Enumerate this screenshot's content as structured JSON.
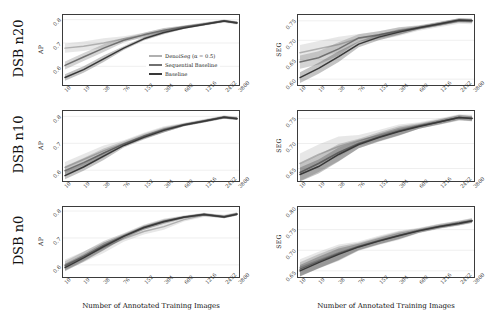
{
  "figure": {
    "xaxis_title": "Number of Annotated Training Images",
    "row_labels": [
      "DSB n20",
      "DSB n10",
      "DSB n0"
    ],
    "col_metrics": [
      "AP",
      "SEG"
    ]
  },
  "legend": {
    "position": "center-right of top-left panel",
    "entries": [
      {
        "label": "DenoiSeg (α = 0.5)",
        "color": "#b0b0b0"
      },
      {
        "label": "Sequential Baseline",
        "color": "#707070"
      },
      {
        "label": "Baseline",
        "color": "#383838"
      }
    ]
  },
  "colors": {
    "denoiseg": "#b0b0b0",
    "sequential_baseline": "#707070",
    "baseline": "#383838",
    "band_opacity": 0.3,
    "axis": "#3b3b3b",
    "grid": "#e3e3e3"
  },
  "chart_data": [
    {
      "id": "dsb-n20-ap",
      "type": "line",
      "title": "",
      "xlabel": "Number of Annotated Training Images",
      "ylabel": "AP",
      "row": "DSB n20",
      "xscale": "log",
      "categories": [
        10,
        19,
        38,
        76,
        152,
        304,
        608,
        1216,
        2432,
        3800
      ],
      "xticklabels": [
        "10",
        "19",
        "38",
        "76",
        "152",
        "304",
        "608",
        "1216",
        "2432",
        "3800"
      ],
      "yticks": [
        0.6,
        0.7,
        0.8
      ],
      "yticklabels": [
        "0.6",
        "0.7",
        "0.8"
      ],
      "ylim": [
        0.52,
        0.82
      ],
      "grid": true,
      "series": [
        {
          "name": "DenoiSeg (α = 0.5)",
          "values": [
            0.678,
            0.686,
            0.7,
            0.718,
            0.733,
            0.752,
            0.768,
            0.78,
            0.793,
            0.785
          ]
        },
        {
          "name": "Sequential Baseline",
          "values": [
            0.604,
            0.64,
            0.678,
            0.712,
            0.735,
            0.755,
            0.77,
            0.782,
            0.795,
            0.788
          ]
        },
        {
          "name": "Baseline",
          "values": [
            0.552,
            0.586,
            0.632,
            0.678,
            0.718,
            0.745,
            0.764,
            0.779,
            0.794,
            0.786
          ]
        }
      ]
    },
    {
      "id": "dsb-n20-seg",
      "type": "line",
      "title": "",
      "xlabel": "Number of Annotated Training Images",
      "ylabel": "SEG",
      "row": "DSB n20",
      "xscale": "log",
      "categories": [
        10,
        19,
        38,
        76,
        152,
        304,
        608,
        1216,
        2432,
        3800
      ],
      "xticklabels": [
        "10",
        "19",
        "38",
        "76",
        "152",
        "304",
        "608",
        "1216",
        "2432",
        "3800"
      ],
      "yticks": [
        0.6,
        0.65,
        0.7,
        0.75
      ],
      "yticklabels": [
        "0.60",
        "0.65",
        "0.70",
        "0.75"
      ],
      "ylim": [
        0.585,
        0.765
      ],
      "grid": true,
      "series": [
        {
          "name": "DenoiSeg (α = 0.5)",
          "values": [
            0.668,
            0.678,
            0.689,
            0.705,
            0.712,
            0.722,
            0.731,
            0.74,
            0.749,
            0.748
          ]
        },
        {
          "name": "Sequential Baseline",
          "values": [
            0.644,
            0.655,
            0.678,
            0.706,
            0.714,
            0.724,
            0.733,
            0.742,
            0.751,
            0.75
          ]
        },
        {
          "name": "Baseline",
          "values": [
            0.604,
            0.628,
            0.658,
            0.69,
            0.708,
            0.721,
            0.732,
            0.742,
            0.752,
            0.751
          ]
        }
      ]
    },
    {
      "id": "dsb-n10-ap",
      "type": "line",
      "title": "",
      "xlabel": "Number of Annotated Training Images",
      "ylabel": "AP",
      "row": "DSB n10",
      "xscale": "log",
      "categories": [
        10,
        19,
        38,
        76,
        152,
        304,
        608,
        1216,
        2432,
        3800
      ],
      "xticklabels": [
        "10",
        "19",
        "38",
        "76",
        "152",
        "304",
        "608",
        "1216",
        "2432",
        "3800"
      ],
      "yticks": [
        0.6,
        0.7,
        0.8
      ],
      "yticklabels": [
        "0.6",
        "0.7",
        "0.8"
      ],
      "ylim": [
        0.56,
        0.82
      ],
      "grid": true,
      "series": [
        {
          "name": "DenoiSeg (α = 0.5)",
          "values": [
            0.61,
            0.64,
            0.672,
            0.7,
            0.728,
            0.752,
            0.77,
            0.784,
            0.798,
            0.793
          ]
        },
        {
          "name": "Sequential Baseline",
          "values": [
            0.598,
            0.628,
            0.664,
            0.698,
            0.726,
            0.75,
            0.769,
            0.783,
            0.797,
            0.792
          ]
        },
        {
          "name": "Baseline",
          "values": [
            0.58,
            0.612,
            0.652,
            0.692,
            0.722,
            0.748,
            0.768,
            0.782,
            0.797,
            0.791
          ]
        }
      ]
    },
    {
      "id": "dsb-n10-seg",
      "type": "line",
      "title": "",
      "xlabel": "Number of Annotated Training Images",
      "ylabel": "SEG",
      "row": "DSB n10",
      "xscale": "log",
      "categories": [
        10,
        19,
        38,
        76,
        152,
        304,
        608,
        1216,
        2432,
        3800
      ],
      "xticklabels": [
        "10",
        "19",
        "38",
        "76",
        "152",
        "304",
        "608",
        "1216",
        "2432",
        "3800"
      ],
      "yticks": [
        0.65,
        0.7,
        0.75
      ],
      "yticklabels": [
        "0.65",
        "0.70",
        "0.75"
      ],
      "ylim": [
        0.625,
        0.765
      ],
      "grid": true,
      "series": [
        {
          "name": "DenoiSeg (α = 0.5)",
          "values": [
            0.66,
            0.678,
            0.694,
            0.706,
            0.716,
            0.727,
            0.736,
            0.744,
            0.752,
            0.751
          ]
        },
        {
          "name": "Sequential Baseline",
          "values": [
            0.642,
            0.66,
            0.682,
            0.7,
            0.713,
            0.725,
            0.735,
            0.743,
            0.752,
            0.75
          ]
        },
        {
          "name": "Baseline",
          "values": [
            0.638,
            0.654,
            0.678,
            0.698,
            0.712,
            0.724,
            0.734,
            0.743,
            0.752,
            0.75
          ]
        }
      ]
    },
    {
      "id": "dsb-n0-ap",
      "type": "line",
      "title": "",
      "xlabel": "Number of Annotated Training Images",
      "ylabel": "AP",
      "row": "DSB n0",
      "xscale": "log",
      "categories": [
        10,
        19,
        38,
        76,
        152,
        304,
        608,
        1216,
        2432,
        3800
      ],
      "xticklabels": [
        "10",
        "19",
        "38",
        "76",
        "152",
        "304",
        "608",
        "1216",
        "2432",
        "3800"
      ],
      "yticks": [
        0.6,
        0.7,
        0.8
      ],
      "yticklabels": [
        "0.6",
        "0.7",
        "0.8"
      ],
      "ylim": [
        0.555,
        0.815
      ],
      "grid": true,
      "series": [
        {
          "name": "DenoiSeg (α = 0.5)",
          "values": [
            0.6,
            0.63,
            0.664,
            0.697,
            0.724,
            0.742,
            0.768,
            0.784,
            0.781,
            0.79
          ]
        },
        {
          "name": "Sequential Baseline",
          "values": [
            0.596,
            0.632,
            0.672,
            0.708,
            0.74,
            0.762,
            0.778,
            0.788,
            0.779,
            0.789
          ]
        },
        {
          "name": "Baseline",
          "values": [
            0.59,
            0.626,
            0.668,
            0.706,
            0.738,
            0.76,
            0.777,
            0.787,
            0.778,
            0.788
          ]
        }
      ]
    },
    {
      "id": "dsb-n0-seg",
      "type": "line",
      "title": "",
      "xlabel": "Number of Annotated Training Images",
      "ylabel": "SEG",
      "row": "DSB n0",
      "xscale": "log",
      "categories": [
        10,
        19,
        38,
        76,
        152,
        304,
        608,
        1216,
        2432,
        3800
      ],
      "xticklabels": [
        "10",
        "19",
        "38",
        "76",
        "152",
        "304",
        "608",
        "1216",
        "2432",
        "3800"
      ],
      "yticks": [
        0.65,
        0.7,
        0.75,
        0.8
      ],
      "yticklabels": [
        "0.65",
        "0.70",
        "0.75",
        "0.80"
      ],
      "ylim": [
        0.635,
        0.805
      ],
      "grid": true,
      "series": [
        {
          "name": "DenoiSeg (α = 0.5)",
          "values": [
            0.658,
            0.676,
            0.694,
            0.71,
            0.724,
            0.736,
            0.748,
            0.758,
            0.766,
            0.772
          ]
        },
        {
          "name": "Sequential Baseline",
          "values": [
            0.654,
            0.673,
            0.692,
            0.709,
            0.723,
            0.736,
            0.748,
            0.758,
            0.766,
            0.772
          ]
        },
        {
          "name": "Baseline",
          "values": [
            0.65,
            0.67,
            0.69,
            0.708,
            0.722,
            0.735,
            0.747,
            0.757,
            0.765,
            0.771
          ]
        }
      ]
    }
  ]
}
